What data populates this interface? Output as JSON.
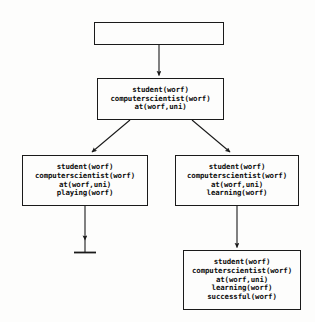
{
  "diagram": {
    "background_color": "#fdfdfc",
    "line_color": "#1a1a1a",
    "text_color": "#0d0d0d",
    "nodes": [
      {
        "id": "root",
        "name": "root-node",
        "lines": []
      },
      {
        "id": "n1",
        "name": "state-node-initial",
        "lines": [
          "student(worf)",
          "computerscientist(worf)",
          "at(worf,uni)"
        ]
      },
      {
        "id": "n2",
        "name": "state-node-playing",
        "lines": [
          "student(worf)",
          "computerscientist(worf)",
          "at(worf,uni)",
          "playing(worf)"
        ]
      },
      {
        "id": "n3",
        "name": "state-node-learning",
        "lines": [
          "student(worf)",
          "computerscientist(worf)",
          "at(worf,uni)",
          "learning(worf)"
        ]
      },
      {
        "id": "n4",
        "name": "state-node-successful",
        "lines": [
          "student(worf)",
          "computerscientist(worf)",
          "at(worf,uni)",
          "learning(worf)",
          "successful(worf)"
        ]
      }
    ],
    "edges": [
      {
        "id": "e-root-n1",
        "name": "edge-root-to-initial",
        "from": "root",
        "to": "n1",
        "kind": "arrow"
      },
      {
        "id": "e-n1-n2",
        "name": "edge-initial-to-playing",
        "from": "n1",
        "to": "n2",
        "kind": "arrow"
      },
      {
        "id": "e-n1-n3",
        "name": "edge-initial-to-learning",
        "from": "n1",
        "to": "n3",
        "kind": "arrow"
      },
      {
        "id": "e-n2-dead",
        "name": "edge-playing-to-deadend",
        "from": "n2",
        "to": "deadend",
        "kind": "arrow-terminator"
      },
      {
        "id": "e-n3-n4",
        "name": "edge-learning-to-successful",
        "from": "n3",
        "to": "n4",
        "kind": "arrow"
      }
    ],
    "terminator": {
      "id": "deadend",
      "name": "dead-end-terminator",
      "label": ""
    }
  }
}
